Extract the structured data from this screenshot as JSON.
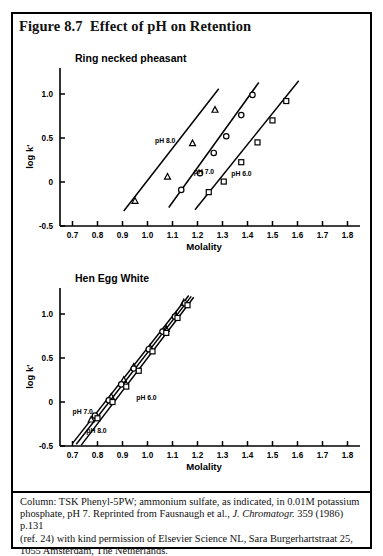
{
  "figure": {
    "title": "Figure 8.7  Effect of pH on Retention",
    "caption_lines": [
      "Column: TSK Phenyl-5PW;  ammonium sulfate, as indicated, in 0.01M potassium",
      "phosphate, pH 7.  Reprinted from Fausnaugh et al., ",
      "(ref. 24) with kind permission of Elsevier Science NL, Sara Burgerhartstraat 25,",
      "1055 Amsterdam, The Netherlands."
    ],
    "caption_italic": "J. Chromatogr.",
    "caption_line2_tail": " 359 (1986) p.131"
  },
  "chart_data": [
    {
      "type": "scatter",
      "title": "Ring necked pheasant",
      "xlabel": "Molality",
      "ylabel": "log k'",
      "xlim": [
        0.65,
        1.85
      ],
      "ylim": [
        -0.5,
        1.25
      ],
      "xticks": [
        "0.7",
        "0.8",
        "0.9",
        "1.0",
        "1.1",
        "1.2",
        "1.3",
        "1.4",
        "1.5",
        "1.6",
        "1.7",
        "1.8"
      ],
      "xtick_values": [
        0.7,
        0.8,
        0.9,
        1.0,
        1.1,
        1.2,
        1.3,
        1.4,
        1.5,
        1.6,
        1.7,
        1.8
      ],
      "yticks": [
        "-0.5",
        "0",
        "0.5",
        "1.0"
      ],
      "ytick_values": [
        -0.5,
        0,
        0.5,
        1.0
      ],
      "grid": false,
      "legend": "inline-annotations",
      "series": [
        {
          "name": "pH 8.0",
          "marker": "triangle",
          "label": "pH 8.0",
          "label_x": 1.03,
          "label_y": 0.44,
          "line": [
            [
              0.905,
              -0.33
            ],
            [
              1.285,
              1.06
            ]
          ],
          "x": [
            0.95,
            1.08,
            1.18,
            1.27
          ],
          "y": [
            -0.215,
            0.06,
            0.44,
            0.82
          ]
        },
        {
          "name": "pH 7.0",
          "marker": "circle",
          "label": "pH 7.0",
          "label_x": 1.185,
          "label_y": 0.09,
          "line": [
            [
              1.085,
              -0.29
            ],
            [
              1.445,
              1.13
            ]
          ],
          "x": [
            1.135,
            1.21,
            1.265,
            1.315,
            1.375,
            1.42
          ],
          "y": [
            -0.09,
            0.1,
            0.33,
            0.52,
            0.76,
            0.99
          ]
        },
        {
          "name": "pH 6.0",
          "marker": "square",
          "label": "pH 6.0",
          "label_x": 1.335,
          "label_y": 0.07,
          "line": [
            [
              1.19,
              -0.315
            ],
            [
              1.605,
              1.15
            ]
          ],
          "x": [
            1.245,
            1.305,
            1.375,
            1.44,
            1.5,
            1.555
          ],
          "y": [
            -0.115,
            0.005,
            0.225,
            0.45,
            0.7,
            0.92
          ]
        }
      ]
    },
    {
      "type": "scatter",
      "title": "Hen Egg White",
      "xlabel": "Molality",
      "ylabel": "log k'",
      "xlim": [
        0.65,
        1.85
      ],
      "ylim": [
        -0.5,
        1.25
      ],
      "xticks": [
        "0.7",
        "0.8",
        "0.9",
        "1.0",
        "1.1",
        "1.2",
        "1.3",
        "1.4",
        "1.5",
        "1.6",
        "1.7",
        "1.8"
      ],
      "xtick_values": [
        0.7,
        0.8,
        0.9,
        1.0,
        1.1,
        1.2,
        1.3,
        1.4,
        1.5,
        1.6,
        1.7,
        1.8
      ],
      "yticks": [
        "-0.5",
        "0",
        "0.5",
        "1.0"
      ],
      "ytick_values": [
        -0.5,
        0,
        0.5,
        1.0
      ],
      "grid": false,
      "legend": "inline-annotations",
      "series": [
        {
          "name": "pH 8.0",
          "marker": "triangle",
          "label": "pH 8.0",
          "label_x": 0.755,
          "label_y": -0.355,
          "line": [
            [
              0.7,
              -0.47
            ],
            [
              1.165,
              1.21
            ]
          ],
          "x": [
            0.775,
            0.855,
            0.905,
            0.945,
            1.01,
            1.075,
            1.115,
            1.145
          ],
          "y": [
            -0.2,
            0.06,
            0.25,
            0.4,
            0.62,
            0.83,
            0.98,
            1.13
          ]
        },
        {
          "name": "pH 7.0",
          "marker": "circle",
          "label": "pH 7.0",
          "label_x": 0.7,
          "label_y": -0.135,
          "line": [
            [
              0.715,
              -0.48
            ],
            [
              1.175,
              1.2
            ]
          ],
          "x": [
            0.79,
            0.845,
            0.895,
            0.945,
            1.005,
            1.06,
            1.11,
            1.15
          ],
          "y": [
            -0.155,
            0.02,
            0.2,
            0.38,
            0.6,
            0.8,
            0.97,
            1.12
          ]
        },
        {
          "name": "pH 6.0",
          "marker": "square",
          "label": "pH 6.0",
          "label_x": 0.955,
          "label_y": 0.02,
          "line": [
            [
              0.735,
              -0.49
            ],
            [
              1.185,
              1.19
            ]
          ],
          "x": [
            0.8,
            0.86,
            0.915,
            0.965,
            1.02,
            1.075,
            1.12,
            1.16
          ],
          "y": [
            -0.185,
            0.0,
            0.175,
            0.355,
            0.575,
            0.785,
            0.955,
            1.1
          ]
        }
      ]
    }
  ],
  "colors": {
    "ink": "#000000",
    "background": "#ffffff"
  }
}
